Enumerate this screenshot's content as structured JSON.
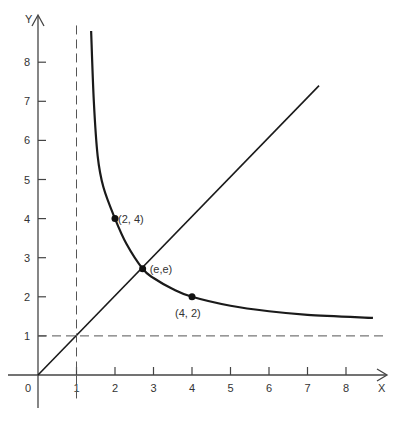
{
  "chart_data": {
    "type": "line",
    "title": "",
    "xlabel": "X",
    "ylabel": "Y",
    "origin_label": "0",
    "xlim": [
      0,
      9
    ],
    "ylim": [
      0,
      9
    ],
    "x_ticks": [
      "1",
      "2",
      "3",
      "4",
      "5",
      "6",
      "7",
      "8"
    ],
    "y_ticks": [
      "1",
      "2",
      "3",
      "4",
      "5",
      "6",
      "7",
      "8"
    ],
    "grid": false,
    "series": [
      {
        "name": "x^y = y^x (nontrivial branch)",
        "style": "solid-thick",
        "points": [
          [
            1.38,
            8.8
          ],
          [
            1.45,
            7.0
          ],
          [
            1.55,
            5.6
          ],
          [
            1.7,
            4.8
          ],
          [
            2.0,
            4.0
          ],
          [
            2.3,
            3.35
          ],
          [
            2.718,
            2.718
          ],
          [
            3.0,
            2.48
          ],
          [
            3.5,
            2.2
          ],
          [
            4.0,
            2.0
          ],
          [
            5.0,
            1.77
          ],
          [
            6.0,
            1.63
          ],
          [
            7.0,
            1.54
          ],
          [
            8.7,
            1.46
          ]
        ]
      },
      {
        "name": "y = x",
        "style": "solid",
        "points": [
          [
            0,
            0
          ],
          [
            7.3,
            7.4
          ]
        ]
      },
      {
        "name": "asymptote x = 1",
        "style": "dashed",
        "points": [
          [
            1,
            -0.6
          ],
          [
            1,
            9.0
          ]
        ]
      },
      {
        "name": "asymptote y = 1",
        "style": "dashed",
        "points": [
          [
            0,
            1
          ],
          [
            9,
            1
          ]
        ]
      }
    ],
    "annotations": [
      {
        "label": "(2, 4)",
        "x": 2,
        "y": 4
      },
      {
        "label": "(e,e)",
        "x": 2.718,
        "y": 2.718
      },
      {
        "label": "(4, 2)",
        "x": 4,
        "y": 2
      }
    ]
  },
  "colors": {
    "line": "#1a1a1a",
    "axis": "#444444",
    "text": "#333333",
    "background": "#ffffff"
  }
}
